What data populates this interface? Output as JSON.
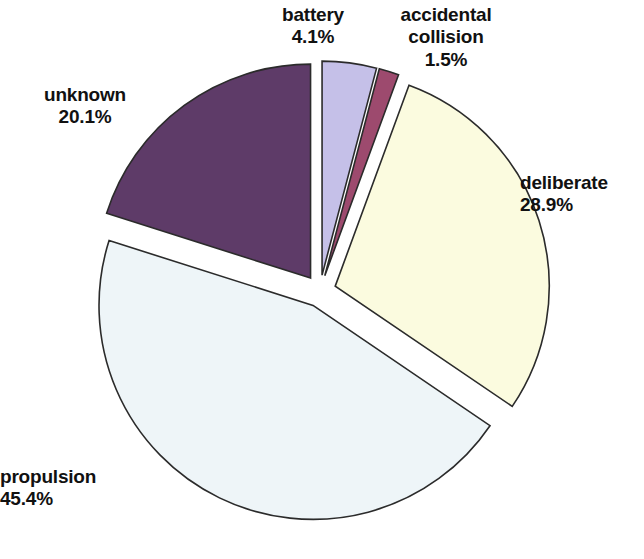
{
  "chart_data": {
    "type": "pie",
    "title": "",
    "subtitle": "",
    "xlabel": "",
    "ylabel": "",
    "legend_position": "none",
    "grid": false,
    "labels_show_percent": true,
    "exploded": true,
    "start_angle_deg": 0,
    "direction": "clockwise",
    "categories": [
      "battery",
      "accidental collision",
      "deliberate",
      "propulsion",
      "unknown"
    ],
    "values": [
      4.1,
      1.5,
      28.9,
      45.4,
      20.1
    ],
    "units": "percent",
    "slices": [
      {
        "label": "battery",
        "value": 4.1,
        "value_text": "4.1%",
        "color": "#c5c0e8",
        "edge_color": "#2b2b2b"
      },
      {
        "label": "accidental collision",
        "value": 1.5,
        "value_text": "1.5%",
        "color": "#9d4a6e",
        "edge_color": "#2b2b2b"
      },
      {
        "label": "deliberate",
        "value": 28.9,
        "value_text": "28.9%",
        "color": "#fbfbdf",
        "edge_color": "#2b2b2b"
      },
      {
        "label": "propulsion",
        "value": 45.4,
        "value_text": "45.4%",
        "color": "#eef5f8",
        "edge_color": "#2b2b2b"
      },
      {
        "label": "unknown",
        "value": 20.1,
        "value_text": "20.1%",
        "color": "#5e3b68",
        "edge_color": "#2b2b2b"
      }
    ]
  },
  "labels": {
    "battery": {
      "name": "battery",
      "value": "4.1%"
    },
    "accidental": {
      "name_line1": "accidental",
      "name_line2": "collision",
      "value": "1.5%"
    },
    "deliberate": {
      "name": "deliberate",
      "value": "28.9%"
    },
    "propulsion": {
      "name": "propulsion",
      "value": "45.4%"
    },
    "unknown": {
      "name": "unknown",
      "value": "20.1%"
    }
  },
  "colors": {
    "background": "#ffffff",
    "outline": "#2b2b2b",
    "text": "#111111"
  }
}
